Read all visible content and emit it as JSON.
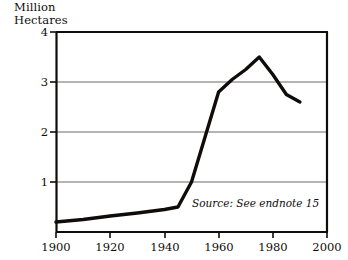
{
  "chart_data": {
    "type": "line",
    "title": "",
    "ylabel": "Million\nHectares",
    "xlabel": "",
    "ylim": [
      0,
      4
    ],
    "xlim": [
      1900,
      2000
    ],
    "yticks": [
      "4",
      "3",
      "2",
      "1"
    ],
    "ytick_values": [
      4,
      3,
      2,
      1
    ],
    "xticks": [
      "1900",
      "1920",
      "1940",
      "1960",
      "1980",
      "2000"
    ],
    "xtick_values": [
      1900,
      1920,
      1940,
      1960,
      1980,
      2000
    ],
    "grid": "horizontal",
    "legend": "none",
    "annotation": "Source: See endnote 15",
    "series": [
      {
        "name": "Area",
        "x": [
          1900,
          1910,
          1920,
          1930,
          1940,
          1945,
          1950,
          1955,
          1960,
          1965,
          1970,
          1975,
          1980,
          1985,
          1990
        ],
        "values": [
          0.2,
          0.25,
          0.32,
          0.38,
          0.45,
          0.5,
          1.0,
          1.9,
          2.8,
          3.05,
          3.25,
          3.5,
          3.15,
          2.75,
          2.6
        ],
        "color": "#100c0a"
      }
    ]
  },
  "axes": {
    "frame_color": "#100c0a",
    "grid_color": "#6a6a6a"
  }
}
